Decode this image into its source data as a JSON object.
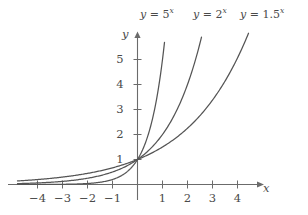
{
  "chart_data": {
    "type": "line",
    "title": "",
    "subtitle": "",
    "xlabel": "x",
    "ylabel": "y",
    "xlim": [
      -4.8,
      5.0
    ],
    "ylim": [
      -0.35,
      6.1
    ],
    "grid": false,
    "legend_position": "above-curves",
    "xticks": [
      -4,
      -3,
      -2,
      -1,
      1,
      2,
      3,
      4
    ],
    "yticks": [
      1,
      2,
      3,
      4,
      5
    ],
    "xtick_labels": [
      "−4",
      "−3",
      "−2",
      "−1",
      "1",
      "2",
      "3",
      "4"
    ],
    "ytick_labels": [
      "1",
      "2",
      "3",
      "4",
      "5"
    ],
    "series": [
      {
        "name": "y = 5^x",
        "base": 5,
        "color": "#555555",
        "x": [
          -4.8,
          -4.5,
          -4,
          -3.5,
          -3,
          -2.5,
          -2,
          -1.5,
          -1,
          -0.5,
          0,
          0.25,
          0.5,
          0.75,
          1,
          1.1,
          1.12
        ],
        "values": [
          0.0005,
          0.0009,
          0.0016,
          0.0036,
          0.008,
          0.0179,
          0.04,
          0.0894,
          0.2,
          0.4472,
          1,
          1.4953,
          2.2361,
          3.3437,
          5,
          6.0,
          6.2
        ]
      },
      {
        "name": "y = 2^x",
        "base": 2,
        "color": "#555555",
        "x": [
          -4.8,
          -4.5,
          -4,
          -3.5,
          -3,
          -2.5,
          -2,
          -1.5,
          -1,
          -0.5,
          0,
          0.5,
          1,
          1.5,
          2,
          2.5,
          2.6
        ],
        "values": [
          0.0359,
          0.0442,
          0.0625,
          0.0884,
          0.125,
          0.1768,
          0.25,
          0.3536,
          0.5,
          0.7071,
          1,
          1.4142,
          2,
          2.8284,
          4,
          5.6569,
          6.06
        ]
      },
      {
        "name": "y = 1.5^x",
        "base": 1.5,
        "color": "#555555",
        "x": [
          -4.8,
          -4.5,
          -4,
          -3.5,
          -3,
          -2.5,
          -2,
          -1.5,
          -1,
          -0.5,
          0,
          0.5,
          1,
          1.5,
          2,
          2.5,
          3,
          3.5,
          4,
          4.4,
          4.45
        ],
        "values": [
          0.1362,
          0.1512,
          0.1975,
          0.2419,
          0.2963,
          0.3629,
          0.4444,
          0.5443,
          0.6667,
          0.8165,
          1,
          1.2247,
          1.5,
          1.8371,
          2.25,
          2.7557,
          3.375,
          4.1335,
          5.0625,
          5.9,
          6.06
        ]
      }
    ],
    "annotations": [
      {
        "text_parts": {
          "y": "y",
          "eq": " = ",
          "base": "5",
          "exp": "x"
        },
        "label": "y = 5^x"
      },
      {
        "text_parts": {
          "y": "y",
          "eq": " = ",
          "base": "2",
          "exp": "x"
        },
        "label": "y = 2^x"
      },
      {
        "text_parts": {
          "y": "y",
          "eq": " = ",
          "base": "1.5",
          "exp": "x"
        },
        "label": "y = 1.5^x"
      }
    ]
  },
  "axes": {
    "x_axis_name": "x",
    "y_axis_name": "y"
  },
  "labels": {
    "curve1": {
      "var": "y",
      "eq": "=",
      "base": "5",
      "exp": "x"
    },
    "curve2": {
      "var": "y",
      "eq": "=",
      "base": "2",
      "exp": "x"
    },
    "curve3": {
      "var": "y",
      "eq": "=",
      "base": "1.5",
      "exp": "x"
    }
  },
  "ticks": {
    "x": {
      "n4": "−4",
      "n3": "−3",
      "n2": "−2",
      "n1": "−1",
      "p1": "1",
      "p2": "2",
      "p3": "3",
      "p4": "4"
    },
    "y": {
      "p1": "1",
      "p2": "2",
      "p3": "3",
      "p4": "4",
      "p5": "5"
    }
  },
  "colors": {
    "background": "#ffffff",
    "axis": "#6b6b6b",
    "curve": "#555555",
    "text": "#4a4a4a"
  }
}
